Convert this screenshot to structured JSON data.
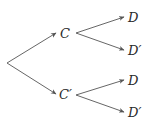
{
  "diagram": {
    "type": "probability-tree",
    "root": {
      "x": 7,
      "y": 63
    },
    "level1": [
      {
        "label": "C",
        "x": 60,
        "y": 37,
        "tip": [
          56,
          33
        ],
        "start": [
          7,
          63
        ]
      },
      {
        "label": "C′",
        "x": 60,
        "y": 98,
        "tip": [
          56,
          94
        ],
        "start": [
          7,
          63
        ]
      }
    ],
    "level2": [
      {
        "label": "D",
        "x": 128,
        "y": 22,
        "start": [
          76,
          33
        ],
        "tip": [
          124,
          17
        ]
      },
      {
        "label": "D′",
        "x": 128,
        "y": 55,
        "start": [
          76,
          33
        ],
        "tip": [
          124,
          50
        ]
      },
      {
        "label": "D",
        "x": 128,
        "y": 85,
        "start": [
          76,
          95
        ],
        "tip": [
          124,
          80
        ]
      },
      {
        "label": "D′",
        "x": 128,
        "y": 117,
        "start": [
          76,
          95
        ],
        "tip": [
          124,
          112
        ]
      }
    ]
  }
}
